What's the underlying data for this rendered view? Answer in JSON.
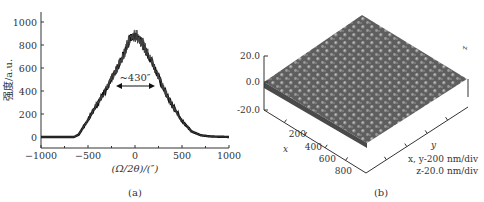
{
  "chart_data": [
    {
      "type": "line",
      "panel_label": "(a)",
      "title": "",
      "xlabel": "(Ω/2θ)/(″)",
      "ylabel": "强度/a.u.",
      "xlim": [
        -1000,
        1000
      ],
      "ylim": [
        -30,
        1050
      ],
      "xticks": [
        "−1000",
        "−500",
        "0",
        "500",
        "1000"
      ],
      "yticks": [
        "0",
        "200",
        "400",
        "600",
        "800",
        "1000"
      ],
      "grid": false,
      "annotation": "~430″",
      "annotation_note": "FWHM double arrow from about -200 to 200 at y≈450",
      "series": [
        {
          "name": "rocking curve",
          "x": [
            -1000,
            -800,
            -650,
            -600,
            -500,
            -400,
            -300,
            -200,
            -100,
            -50,
            0,
            50,
            100,
            200,
            300,
            400,
            500,
            600,
            700,
            800,
            1000
          ],
          "y": [
            0,
            0,
            0,
            20,
            150,
            290,
            430,
            580,
            760,
            860,
            880,
            860,
            780,
            620,
            430,
            270,
            140,
            50,
            15,
            5,
            0
          ]
        }
      ]
    },
    {
      "type": "surface",
      "panel_label": "(b)",
      "z_ticks": [
        "20.0",
        "0.0",
        "-20.0"
      ],
      "x_ticks": [
        "200",
        "400",
        "600",
        "800"
      ],
      "x_label": "x",
      "y_label": "y",
      "z_label": "z",
      "scale_xy": "x, y-200 nm/div",
      "scale_z": "z-20.0 nm/div"
    }
  ]
}
